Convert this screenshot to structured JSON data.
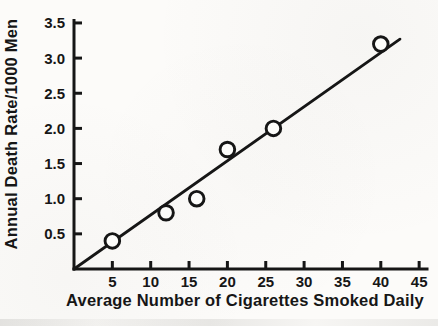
{
  "chart_data": {
    "type": "scatter",
    "title": "",
    "xlabel": "Average Number of Cigarettes Smoked Daily",
    "ylabel": "Annual Death Rate/1000 Men",
    "xlim": [
      0,
      45.7
    ],
    "ylim": [
      0,
      3.55
    ],
    "x_ticks": [
      "5",
      "10",
      "15",
      "20",
      "25",
      "30",
      "35",
      "40",
      "45"
    ],
    "y_ticks": [
      "0.5",
      "1.0",
      "1.5",
      "2.0",
      "2.5",
      "3.0",
      "3.5"
    ],
    "grid": false,
    "legend": null,
    "marker": "open-circle",
    "points": [
      [
        5,
        0.4
      ],
      [
        12,
        0.8
      ],
      [
        16,
        1.0
      ],
      [
        20,
        1.7
      ],
      [
        26,
        2.0
      ],
      [
        40,
        3.2
      ]
    ],
    "fit_line": {
      "x1": 0,
      "y1": 0,
      "x2": 42.5,
      "y2": 3.27
    },
    "colors": {
      "ink": "#161616",
      "background": "#fcfbf9",
      "marker_fill": "#fdfdfb"
    }
  }
}
